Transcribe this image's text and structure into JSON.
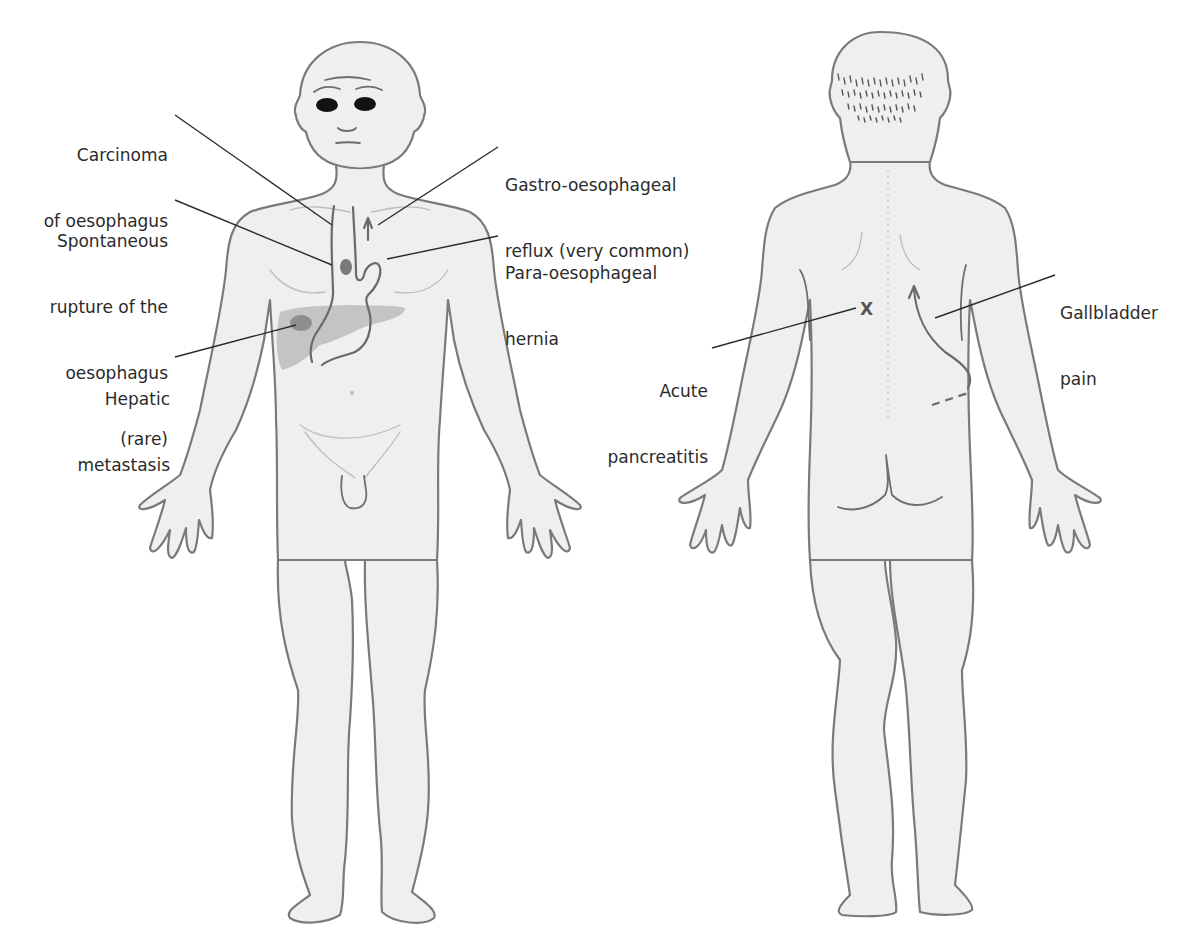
{
  "figure": {
    "views": [
      {
        "id": "anterior",
        "name": "Front view"
      },
      {
        "id": "posterior",
        "name": "Back view"
      }
    ],
    "colors": {
      "skin": "#efefef",
      "outline": "#7a7a7a",
      "liver": "#c4c4c4",
      "metastasis": "#8e8e8e",
      "text": "#2b2b2b",
      "leader": "#2a2a2a"
    },
    "labels": {
      "carcinoma": {
        "line1": "Carcinoma",
        "line2": "of oesophagus"
      },
      "rupture": {
        "line1": "Spontaneous",
        "line2": "rupture of the",
        "line3": "oesophagus",
        "line4": "(rare)"
      },
      "hepatic": {
        "line1": "Hepatic",
        "line2": "metastasis"
      },
      "reflux": {
        "line1": "Gastro-oesophageal",
        "line2": "reflux (very common)"
      },
      "hernia": {
        "line1": "Para-oesophageal",
        "line2": "hernia"
      },
      "pancreatitis": {
        "line1": "Acute",
        "line2": "pancreatitis"
      },
      "gallbladder": {
        "line1": "Gallbladder",
        "line2": "pain"
      }
    },
    "marker": {
      "pancreatitis_symbol": "X"
    }
  }
}
